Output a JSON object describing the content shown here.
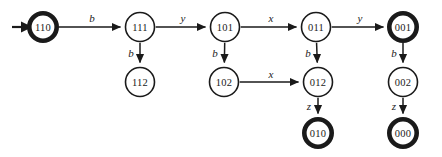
{
  "diagram": {
    "type": "state-transition-diagram",
    "title": "",
    "canvas": {
      "width": 442,
      "height": 157
    },
    "node_radius": 14.5,
    "accept_ring_note": "thick outline denotes accepting state",
    "nodes": [
      {
        "id": "110",
        "label": "110",
        "x": 43,
        "y": 27,
        "accepting": true,
        "initial": true
      },
      {
        "id": "111",
        "label": "111",
        "x": 140,
        "y": 27,
        "accepting": false,
        "initial": false
      },
      {
        "id": "101",
        "label": "101",
        "x": 225,
        "y": 27,
        "accepting": false,
        "initial": false
      },
      {
        "id": "011",
        "label": "011",
        "x": 316,
        "y": 27,
        "accepting": false,
        "initial": false
      },
      {
        "id": "001",
        "label": "001",
        "x": 403,
        "y": 27,
        "accepting": true,
        "initial": false
      },
      {
        "id": "112",
        "label": "112",
        "x": 140,
        "y": 82,
        "accepting": false,
        "initial": false
      },
      {
        "id": "102",
        "label": "102",
        "x": 224,
        "y": 82,
        "accepting": false,
        "initial": false
      },
      {
        "id": "012",
        "label": "012",
        "x": 318,
        "y": 82,
        "accepting": false,
        "initial": false
      },
      {
        "id": "002",
        "label": "002",
        "x": 403,
        "y": 82,
        "accepting": false,
        "initial": false
      },
      {
        "id": "010",
        "label": "010",
        "x": 318,
        "y": 133,
        "accepting": true,
        "initial": false
      },
      {
        "id": "000",
        "label": "000",
        "x": 403,
        "y": 133,
        "accepting": true,
        "initial": false
      }
    ],
    "edges": [
      {
        "from": "110",
        "to": "111",
        "label": "b",
        "label_x": 92,
        "label_y": 18
      },
      {
        "from": "111",
        "to": "101",
        "label": "y",
        "label_x": 183,
        "label_y": 18
      },
      {
        "from": "101",
        "to": "011",
        "label": "x",
        "label_x": 271,
        "label_y": 18
      },
      {
        "from": "011",
        "to": "001",
        "label": "y",
        "label_x": 360,
        "label_y": 18
      },
      {
        "from": "111",
        "to": "112",
        "label": "b",
        "label_x": 131,
        "label_y": 53
      },
      {
        "from": "101",
        "to": "102",
        "label": "b",
        "label_x": 215,
        "label_y": 53
      },
      {
        "from": "011",
        "to": "012",
        "label": "b",
        "label_x": 308,
        "label_y": 53
      },
      {
        "from": "001",
        "to": "002",
        "label": "b",
        "label_x": 394,
        "label_y": 53
      },
      {
        "from": "102",
        "to": "012",
        "label": "x",
        "label_x": 271,
        "label_y": 74
      },
      {
        "from": "012",
        "to": "010",
        "label": "z",
        "label_x": 309,
        "label_y": 106
      },
      {
        "from": "002",
        "to": "000",
        "label": "z",
        "label_x": 394,
        "label_y": 106
      }
    ],
    "start_marker": {
      "target": "110",
      "from_x": 12,
      "to_x": 28,
      "y": 27
    }
  }
}
